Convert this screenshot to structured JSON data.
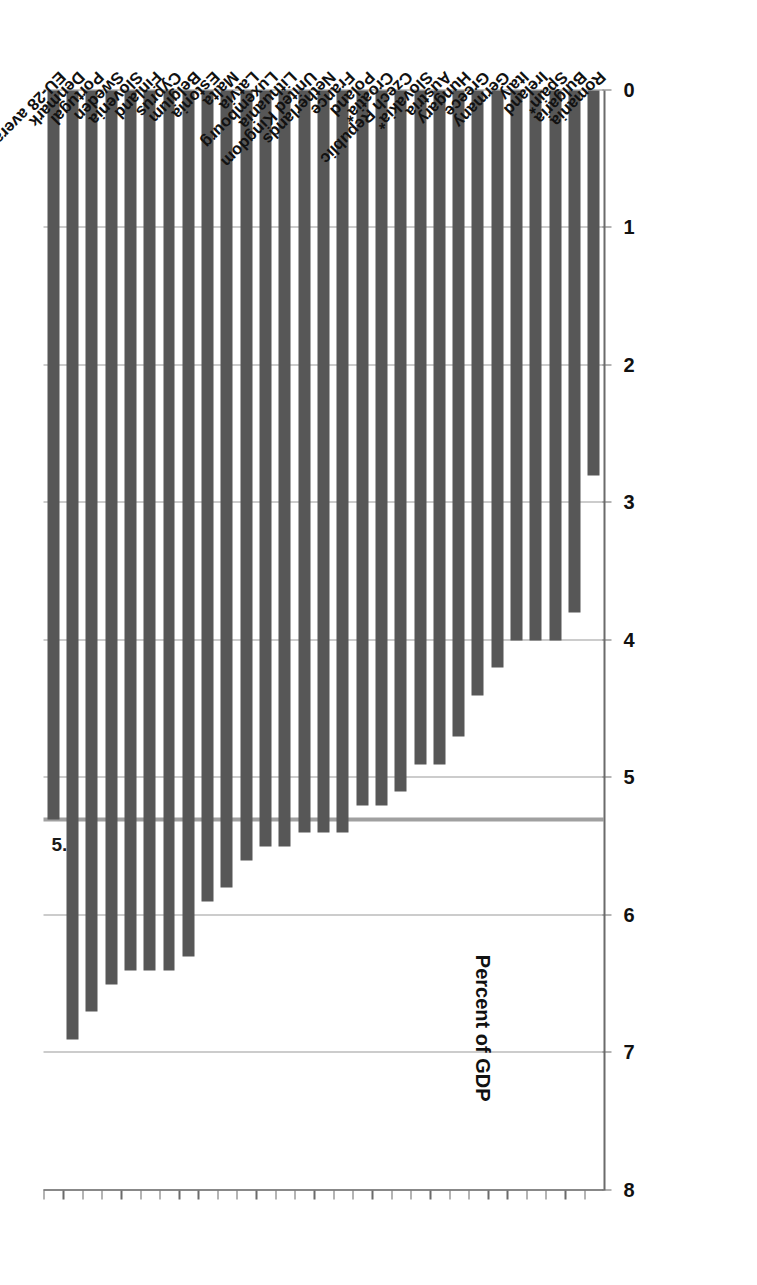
{
  "chart": {
    "axis_title": "Percent of GDP",
    "reference_label": "5.3",
    "tick_labels": [
      "0",
      "1",
      "2",
      "3",
      "4",
      "5",
      "6",
      "7",
      "8"
    ]
  },
  "chart_data": {
    "type": "bar",
    "orientation": "horizontal",
    "title": "",
    "subtitle": "",
    "xlabel": "Percent of GDP",
    "ylabel": "",
    "xlim": [
      0,
      8
    ],
    "grid": true,
    "legend": "none",
    "annotations": [
      {
        "label": "5.3",
        "value": 5.3,
        "kind": "reference-line"
      }
    ],
    "categories": [
      "EU-28 average",
      "Denmark",
      "Portugal",
      "Sweden",
      "Slovenia",
      "Finland",
      "Cyprus",
      "Belgium",
      "Estonia",
      "Malta",
      "Latvia",
      "Luxembourg",
      "Lithuania",
      "United Kingdom",
      "Netherlands",
      "France",
      "Poland",
      "Croatia*",
      "Czech Republic",
      "Slovakia*",
      "Austria",
      "Hungary",
      "Greece",
      "Germany",
      "Italy",
      "Ireland",
      "Spain*",
      "Bulgaria",
      "Romania"
    ],
    "values": [
      5.3,
      6.9,
      6.7,
      6.5,
      6.4,
      6.4,
      6.4,
      6.3,
      5.9,
      5.8,
      5.6,
      5.5,
      5.5,
      5.4,
      5.4,
      5.4,
      5.2,
      5.2,
      5.1,
      4.9,
      4.9,
      4.7,
      4.4,
      4.2,
      4.0,
      4.0,
      4.0,
      3.8,
      2.8
    ],
    "colors": {
      "bar": "#575757",
      "grid": "#9a9a9a",
      "axis": "#6b6b6b",
      "reference_line": "#a0a0a0",
      "text": "#111111",
      "background": "#ffffff"
    }
  }
}
